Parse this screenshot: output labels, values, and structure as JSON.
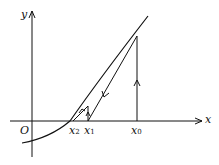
{
  "diagram": {
    "axes": {
      "x_label": "x",
      "y_label": "y",
      "origin_label": "O"
    },
    "points": [
      {
        "name": "x0",
        "base": "x",
        "sub": "0"
      },
      {
        "name": "x1",
        "base": "x",
        "sub": "1"
      },
      {
        "name": "x2",
        "base": "x",
        "sub": "2"
      }
    ],
    "colors": {
      "line": "#111111",
      "background": "#ffffff"
    }
  }
}
